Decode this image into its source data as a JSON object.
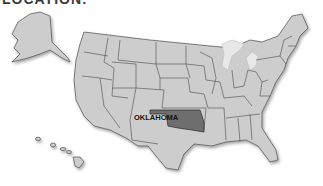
{
  "header": {
    "title": "LOCATION:"
  },
  "map": {
    "type": "choropleth",
    "region": "United States",
    "highlighted_state": "OKLAHOMA",
    "label": "OKLAHOMA",
    "colors": {
      "state_fill": "#cdcdcd",
      "state_border": "#4a4a4a",
      "highlight_fill": "#6e6e6e",
      "background": "#ffffff"
    },
    "insets": [
      "Alaska",
      "Hawaii"
    ]
  }
}
